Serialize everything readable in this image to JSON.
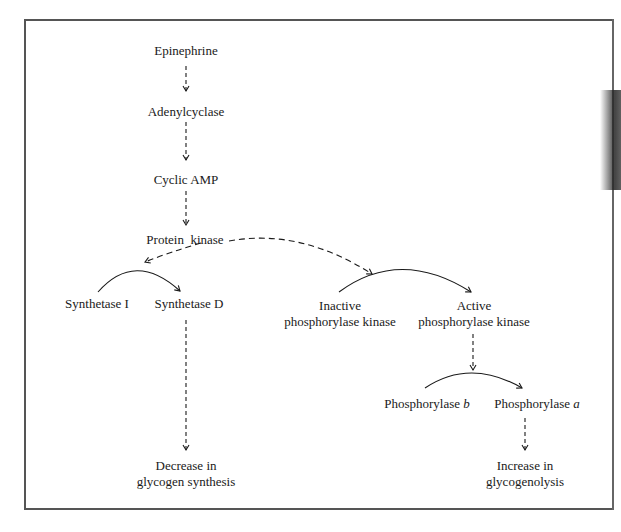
{
  "diagram": {
    "nodes": {
      "epinephrine": "Epinephrine",
      "adenylcyclase": "Adenylcyclase",
      "cyclic_amp": "Cyclic AMP",
      "protein_kinase": "Protein  kinase",
      "synthetase_i": "Synthetase I",
      "synthetase_d": "Synthetase D",
      "inactive_pk_1": "Inactive",
      "inactive_pk_2": "phosphorylase kinase",
      "active_pk_1": "Active",
      "active_pk_2": "phosphorylase kinase",
      "phos_b_text": "Phosphorylase ",
      "phos_b_italic": "b",
      "phos_a_text": "Phosphorylase ",
      "phos_a_italic": "a",
      "decrease_1": "Decrease in",
      "decrease_2": "glycogen synthesis",
      "increase_1": "Increase in",
      "increase_2": "glycogenolysis"
    },
    "edges": [
      {
        "from": "Epinephrine",
        "to": "Adenylcyclase",
        "style": "dashed"
      },
      {
        "from": "Adenylcyclase",
        "to": "Cyclic AMP",
        "style": "dashed"
      },
      {
        "from": "Cyclic AMP",
        "to": "Protein kinase",
        "style": "dashed"
      },
      {
        "from": "Protein kinase",
        "to": "Synthetase I → Synthetase D conversion",
        "style": "dashed"
      },
      {
        "from": "Protein kinase",
        "to": "Inactive → Active phosphorylase kinase conversion",
        "style": "dashed"
      },
      {
        "from": "Synthetase I",
        "to": "Synthetase D",
        "style": "solid-arc"
      },
      {
        "from": "Inactive phosphorylase kinase",
        "to": "Active phosphorylase kinase",
        "style": "solid-arc"
      },
      {
        "from": "Active phosphorylase kinase",
        "to": "Phosphorylase b → a conversion",
        "style": "dashed"
      },
      {
        "from": "Phosphorylase b",
        "to": "Phosphorylase a",
        "style": "solid-arc"
      },
      {
        "from": "Synthetase D",
        "to": "Decrease in glycogen synthesis",
        "style": "dashed"
      },
      {
        "from": "Phosphorylase a",
        "to": "Increase in glycogenolysis",
        "style": "dashed"
      }
    ],
    "colors": {
      "ink": "#1a1a1a",
      "frame": "#555555"
    }
  }
}
